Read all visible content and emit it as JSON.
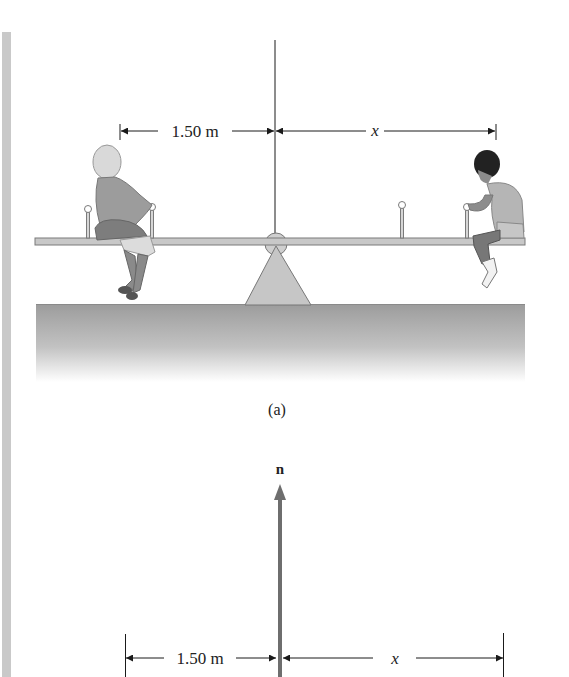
{
  "figure_a": {
    "caption": "(a)",
    "left_distance_label": "1.50 m",
    "right_distance_label": "x",
    "left_person": "girl",
    "right_person": "boy"
  },
  "figure_b": {
    "force_label": "n",
    "left_distance_label": "1.50 m",
    "right_distance_label": "x"
  },
  "colors": {
    "line": "#1a1a1a",
    "beam": "#bdbdbd",
    "fulcrum": "#c4c4c4",
    "ground_top": "#9a9a9a",
    "force_arrow": "#6e6e6e",
    "strip": "#c9c9c9"
  }
}
